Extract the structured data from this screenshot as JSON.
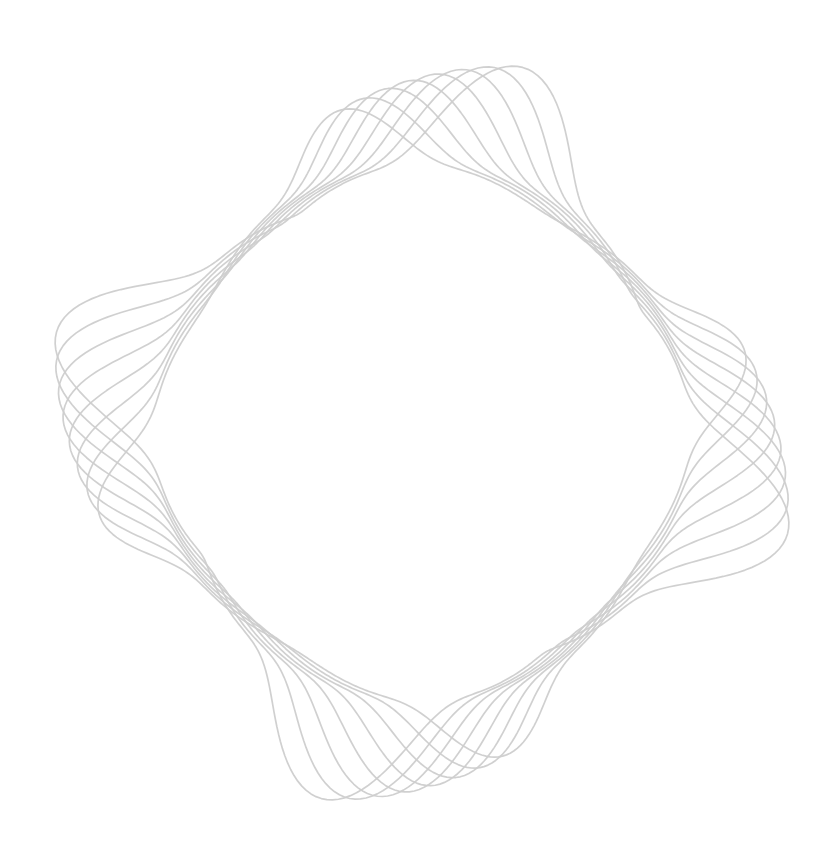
{
  "artwork": {
    "type": "spirograph-ring",
    "background": "#ffffff",
    "stroke_color": "#cdcdcd",
    "stroke_width": 1.7,
    "opacity": 0.95,
    "center": [
      422,
      433
    ],
    "curve_count": 8,
    "rotation_step_deg": 4.2,
    "base_rotation_deg": -14,
    "inner_radius": 262,
    "spike_radius": 372,
    "squareness": 0.5
  }
}
